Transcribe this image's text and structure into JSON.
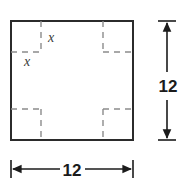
{
  "figure": {
    "type": "geometry-diagram",
    "background_color": "#ffffff",
    "outline_color": "#2b2b2b",
    "dashed_color": "#8c8c8c",
    "text_color": "#1b1b1b",
    "variable_text_color": "#3a3a3a",
    "main_square": {
      "name": "outer-square",
      "x": 11,
      "y": 21,
      "width": 122,
      "height": 119,
      "stroke_width": 2,
      "side_length_label": "12"
    },
    "corner_cutouts": {
      "count": 4,
      "size": 30,
      "side_label": "x",
      "stroke_dash": "6 5",
      "stroke_width": 1.4,
      "items": [
        {
          "name": "corner-cutout-top-left",
          "corner": "top-left",
          "vertical_dash_x": 41,
          "horizontal_dash_y": 52
        },
        {
          "name": "corner-cutout-top-right",
          "corner": "top-right",
          "vertical_dash_x": 103,
          "horizontal_dash_y": 52
        },
        {
          "name": "corner-cutout-bottom-left",
          "corner": "bottom-left",
          "vertical_dash_x": 41,
          "horizontal_dash_y": 109
        },
        {
          "name": "corner-cutout-bottom-right",
          "corner": "bottom-right",
          "vertical_dash_x": 103,
          "horizontal_dash_y": 109
        }
      ]
    },
    "variable_labels": [
      {
        "name": "x-label-vertical",
        "text": "x",
        "x": 48,
        "y": 42,
        "describes": "height of corner square"
      },
      {
        "name": "x-label-horizontal",
        "text": "x",
        "x": 24,
        "y": 66,
        "describes": "width of corner square"
      }
    ],
    "dimensions": [
      {
        "name": "vertical-dimension",
        "orientation": "vertical",
        "value": "12",
        "line_x": 167,
        "start": 21,
        "end": 140,
        "tick_half_length": 9,
        "label_x": 169,
        "label_y": 86
      },
      {
        "name": "horizontal-dimension",
        "orientation": "horizontal",
        "value": "12",
        "line_y": 169,
        "start": 11,
        "end": 133,
        "tick_half_length": 9,
        "label_x": 72,
        "label_y": 175
      }
    ]
  }
}
